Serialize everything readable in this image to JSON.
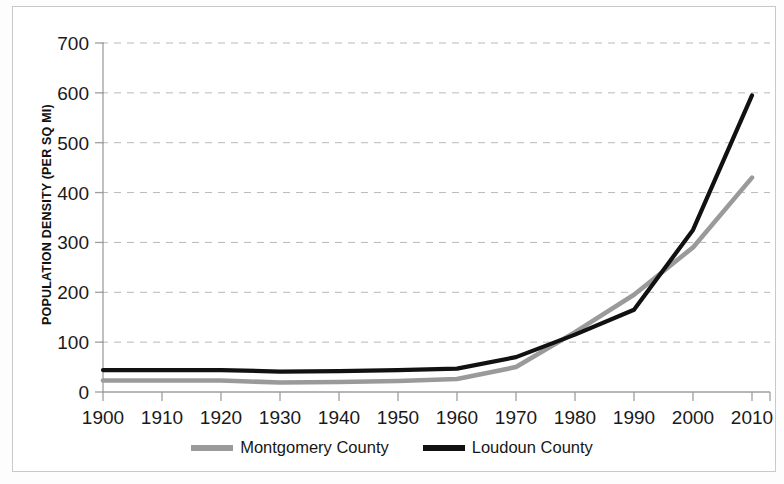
{
  "chart_data": {
    "type": "line",
    "title": "",
    "subtitle": "",
    "xlabel": "",
    "ylabel": "POPULATION DENSITY (PER SQ MI)",
    "x": [
      1900,
      1910,
      1920,
      1930,
      1940,
      1950,
      1960,
      1970,
      1980,
      1990,
      2000,
      2010
    ],
    "xtick_labels": [
      "1900",
      "1910",
      "1920",
      "1930",
      "1940",
      "1950",
      "1960",
      "1970",
      "1980",
      "1990",
      "2000",
      "2010"
    ],
    "ytick_labels": [
      "0",
      "100",
      "200",
      "300",
      "400",
      "500",
      "600",
      "700"
    ],
    "yticks": [
      0,
      100,
      200,
      300,
      400,
      500,
      600,
      700
    ],
    "ylim": [
      0,
      700
    ],
    "xlim": [
      1900,
      2010
    ],
    "grid": "horizontal-dashed",
    "legend_position": "bottom-center",
    "series": [
      {
        "name": "Montgomery County",
        "color": "#9a9a9a",
        "values": [
          23,
          23,
          23,
          19,
          20,
          22,
          26,
          50,
          120,
          195,
          290,
          430
        ]
      },
      {
        "name": "Loudoun County",
        "color": "#111111",
        "values": [
          44,
          44,
          44,
          41,
          42,
          44,
          47,
          70,
          115,
          165,
          325,
          595
        ]
      }
    ]
  },
  "axes": {
    "y_title": "POPULATION DENSITY (PER SQ MI)"
  },
  "legend": {
    "entries": [
      {
        "label": "Montgomery County",
        "color": "#9a9a9a"
      },
      {
        "label": "Loudoun County",
        "color": "#111111"
      }
    ]
  },
  "colors": {
    "montgomery": "#9a9a9a",
    "loudoun": "#111111",
    "grid": "#b9b9b9",
    "axis": "#9e9e9e",
    "frame": "#c9c9c9",
    "text": "#1a1a1a"
  }
}
